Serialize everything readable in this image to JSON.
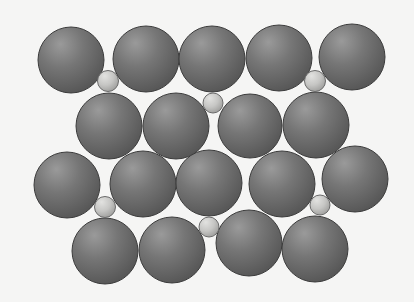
{
  "diagram": {
    "background": "#f5f5f4",
    "colors": {
      "large_highlight": "#9a9a9a",
      "large_body": "#767676",
      "large_edge": "#555555",
      "large_outline": "#3c3c3c",
      "small_highlight": "#e2e2e0",
      "small_body": "#c6c6c4",
      "small_edge": "#9e9e9c",
      "small_outline": "#6a6a6a"
    },
    "large_spheres": [
      {
        "row": 1,
        "cx": 71,
        "cy": 60,
        "r": 33
      },
      {
        "row": 1,
        "cx": 146,
        "cy": 59,
        "r": 33
      },
      {
        "row": 1,
        "cx": 212,
        "cy": 59,
        "r": 33
      },
      {
        "row": 1,
        "cx": 279,
        "cy": 58,
        "r": 33
      },
      {
        "row": 1,
        "cx": 352,
        "cy": 57,
        "r": 33
      },
      {
        "row": 2,
        "cx": 109,
        "cy": 126,
        "r": 33
      },
      {
        "row": 2,
        "cx": 176,
        "cy": 126,
        "r": 33
      },
      {
        "row": 2,
        "cx": 250,
        "cy": 126,
        "r": 32
      },
      {
        "row": 2,
        "cx": 316,
        "cy": 125,
        "r": 33
      },
      {
        "row": 3,
        "cx": 67,
        "cy": 185,
        "r": 33
      },
      {
        "row": 3,
        "cx": 143,
        "cy": 184,
        "r": 33
      },
      {
        "row": 3,
        "cx": 209,
        "cy": 183,
        "r": 33
      },
      {
        "row": 3,
        "cx": 282,
        "cy": 184,
        "r": 33
      },
      {
        "row": 3,
        "cx": 355,
        "cy": 179,
        "r": 33
      },
      {
        "row": 4,
        "cx": 105,
        "cy": 251,
        "r": 33
      },
      {
        "row": 4,
        "cx": 172,
        "cy": 250,
        "r": 33
      },
      {
        "row": 4,
        "cx": 249,
        "cy": 243,
        "r": 33
      },
      {
        "row": 4,
        "cx": 315,
        "cy": 249,
        "r": 33
      }
    ],
    "small_spheres": [
      {
        "cx": 108,
        "cy": 81,
        "r": 10.5
      },
      {
        "cx": 213,
        "cy": 103,
        "r": 10
      },
      {
        "cx": 315,
        "cy": 81,
        "r": 10.5
      },
      {
        "cx": 105,
        "cy": 207,
        "r": 10.5
      },
      {
        "cx": 320,
        "cy": 205,
        "r": 10
      },
      {
        "cx": 209,
        "cy": 227,
        "r": 10
      }
    ]
  }
}
